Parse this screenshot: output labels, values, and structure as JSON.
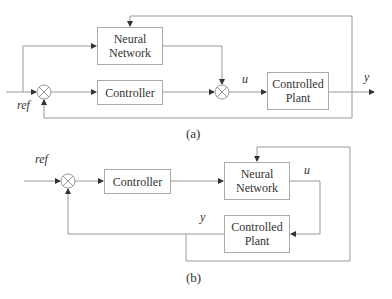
{
  "diagram_a": {
    "caption": "(a)",
    "blocks": {
      "neural_network": "Neural\nNetwork",
      "controller": "Controller",
      "plant": "Controlled\nPlant"
    },
    "labels": {
      "ref": "ref",
      "u": "u",
      "y": "y"
    }
  },
  "diagram_b": {
    "caption": "(b)",
    "blocks": {
      "controller": "Controller",
      "neural_network": "Neural\nNetwork",
      "plant": "Controlled\nPlant"
    },
    "labels": {
      "ref": "ref",
      "u": "u",
      "y": "y"
    }
  },
  "colors": {
    "line": "#888888",
    "box_border": "#aaaaaa",
    "text": "#333333"
  }
}
